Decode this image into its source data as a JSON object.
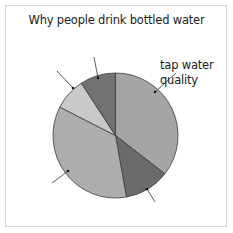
{
  "chart_data": {
    "type": "pie",
    "title": "Why people drink bottled water",
    "start_angle_deg": 0,
    "direction": "clockwise",
    "slices": [
      {
        "label": "tap water quality",
        "value": 35.5,
        "color": "#a5a5a5"
      },
      {
        "label": "",
        "value": 11.7,
        "color": "#6b6b6b"
      },
      {
        "label": "",
        "value": 35.3,
        "color": "#adadad"
      },
      {
        "label": "",
        "value": 8.3,
        "color": "#c9c9c9"
      },
      {
        "label": "",
        "value": 9.2,
        "color": "#727272"
      }
    ],
    "legend": "none"
  },
  "labels": {
    "title": "Why people drink bottled water",
    "tap_line1": "tap water",
    "tap_line2": "quality"
  },
  "geometry": {
    "cx": 115.5,
    "cy": 135.5,
    "r": 62.5
  },
  "leaders": [
    {
      "x1": 155,
      "y1": 92,
      "x2": 176,
      "y2": 73
    },
    {
      "x1": 98,
      "y1": 78,
      "x2": 94,
      "y2": 57
    },
    {
      "x1": 73,
      "y1": 88,
      "x2": 57,
      "y2": 71
    },
    {
      "x1": 68,
      "y1": 171,
      "x2": 52,
      "y2": 183
    },
    {
      "x1": 147,
      "y1": 189,
      "x2": 155,
      "y2": 202
    }
  ]
}
